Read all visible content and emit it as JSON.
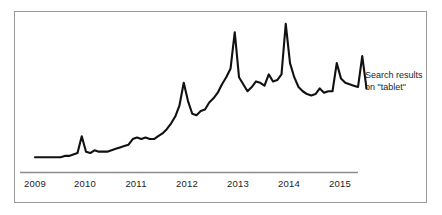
{
  "chart_data": {
    "type": "line",
    "title": "",
    "xlabel": "",
    "ylabel": "",
    "grid": false,
    "legend_position": "inline-right",
    "annotations": [
      {
        "name": "series-label",
        "line1": "Search results",
        "line2": "on \"tablet\"",
        "target_series": "Search results on \"tablet\""
      }
    ],
    "axis": {
      "x_tick_labels": [
        "2009",
        "2010",
        "2011",
        "2012",
        "2013",
        "2014",
        "2015"
      ],
      "x_range": [
        "2009-01",
        "2015-08"
      ],
      "y_range": [
        0,
        100
      ],
      "y_ticks_visible": false,
      "x_axis_line_color": "#8c8c8c"
    },
    "series": [
      {
        "name": "Search results on \"tablet\"",
        "color": "#111111",
        "x": [
          "2009-01",
          "2009-02",
          "2009-03",
          "2009-04",
          "2009-05",
          "2009-06",
          "2009-07",
          "2009-08",
          "2009-09",
          "2009-10",
          "2009-11",
          "2009-12",
          "2010-01",
          "2010-02",
          "2010-03",
          "2010-04",
          "2010-05",
          "2010-06",
          "2010-07",
          "2010-08",
          "2010-09",
          "2010-10",
          "2010-11",
          "2010-12",
          "2011-01",
          "2011-02",
          "2011-03",
          "2011-04",
          "2011-05",
          "2011-06",
          "2011-07",
          "2011-08",
          "2011-09",
          "2011-10",
          "2011-11",
          "2011-12",
          "2012-01",
          "2012-02",
          "2012-03",
          "2012-04",
          "2012-05",
          "2012-06",
          "2012-07",
          "2012-08",
          "2012-09",
          "2012-10",
          "2012-11",
          "2012-12",
          "2013-01",
          "2013-02",
          "2013-03",
          "2013-04",
          "2013-05",
          "2013-06",
          "2013-07",
          "2013-08",
          "2013-09",
          "2013-10",
          "2013-11",
          "2013-12",
          "2014-01",
          "2014-02",
          "2014-03",
          "2014-04",
          "2014-05",
          "2014-06",
          "2014-07",
          "2014-08",
          "2014-09",
          "2014-10",
          "2014-11",
          "2014-12",
          "2015-01",
          "2015-02",
          "2015-03",
          "2015-04",
          "2015-05",
          "2015-06",
          "2015-07"
        ],
        "values": [
          3,
          3,
          3,
          3,
          3,
          3,
          3,
          4,
          4,
          5,
          6,
          18,
          7,
          6,
          8,
          7,
          7,
          7,
          8,
          9,
          10,
          11,
          12,
          16,
          17,
          16,
          17,
          16,
          16,
          18,
          20,
          23,
          27,
          32,
          40,
          56,
          43,
          34,
          33,
          36,
          37,
          42,
          45,
          49,
          55,
          60,
          66,
          92,
          60,
          55,
          50,
          53,
          57,
          56,
          54,
          62,
          57,
          58,
          62,
          98,
          70,
          60,
          53,
          50,
          48,
          47,
          48,
          52,
          49,
          50,
          50,
          70,
          59,
          56,
          55,
          54,
          53,
          75,
          52
        ]
      }
    ]
  },
  "figure": {
    "border_color": "#9a9a9a",
    "background": "#ffffff"
  }
}
